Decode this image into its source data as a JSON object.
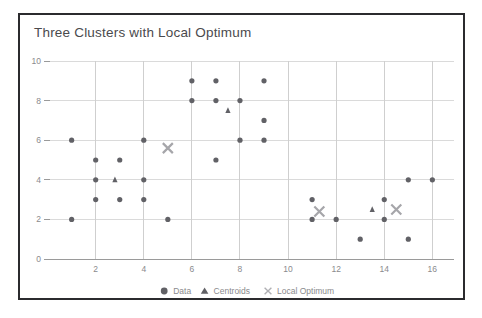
{
  "chart_data": {
    "type": "scatter",
    "title": "Three Clusters with Local Optimum",
    "xlabel": "",
    "ylabel": "",
    "xlim": [
      0.1,
      16.9
    ],
    "ylim": [
      0,
      10
    ],
    "xticks": [
      2,
      4,
      6,
      8,
      10,
      12,
      14,
      16
    ],
    "yticks": [
      0,
      2,
      4,
      6,
      8,
      10
    ],
    "grid": true,
    "legend_position": "bottom-center",
    "series": [
      {
        "name": "Data",
        "marker": "circle",
        "color": "#616166",
        "points": [
          [
            1,
            6
          ],
          [
            1,
            2
          ],
          [
            2,
            5
          ],
          [
            2,
            4
          ],
          [
            2,
            3
          ],
          [
            3,
            5
          ],
          [
            3,
            3
          ],
          [
            4,
            6
          ],
          [
            4,
            4
          ],
          [
            4,
            3
          ],
          [
            5,
            2
          ],
          [
            6,
            9
          ],
          [
            6,
            8
          ],
          [
            7,
            9
          ],
          [
            7,
            8
          ],
          [
            7,
            5
          ],
          [
            8,
            8
          ],
          [
            8,
            6
          ],
          [
            9,
            9
          ],
          [
            9,
            7
          ],
          [
            9,
            6
          ],
          [
            11,
            3
          ],
          [
            11,
            2
          ],
          [
            12,
            2
          ],
          [
            13,
            1
          ],
          [
            14,
            3
          ],
          [
            14,
            2
          ],
          [
            15,
            4
          ],
          [
            15,
            1
          ],
          [
            16,
            4
          ]
        ]
      },
      {
        "name": "Centroids",
        "marker": "triangle",
        "color": "#616166",
        "points": [
          [
            2.8,
            4.0
          ],
          [
            7.5,
            7.5
          ],
          [
            13.5,
            2.5
          ]
        ]
      },
      {
        "name": "Local Optimum",
        "marker": "x",
        "color": "#a6a6aa",
        "points": [
          [
            5.0,
            5.6
          ],
          [
            11.3,
            2.4
          ],
          [
            14.5,
            2.5
          ]
        ]
      }
    ],
    "legend": [
      {
        "label": "Data",
        "marker": "circle"
      },
      {
        "label": "Centroids",
        "marker": "triangle"
      },
      {
        "label": "Local Optimum",
        "marker": "x"
      }
    ]
  }
}
